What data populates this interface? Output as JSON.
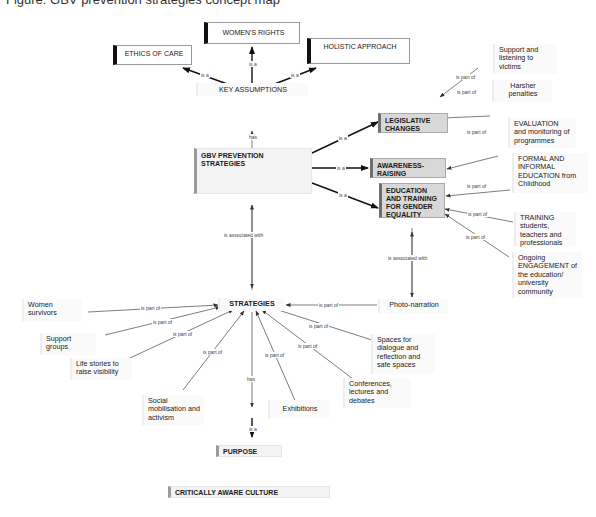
{
  "caption": "Figure: GBV prevention strategies concept map",
  "nodes": {
    "womens_rights": "WOMEN'S RIGHTS",
    "ethics_of_care": "ETHICS OF CARE",
    "holistic_approach": "HOLISTIC APPROACH",
    "key_assumptions": "KEY ASSUMPTIONS",
    "gbv": "GBV PREVENTION STRATEGIES",
    "legislative": "LEGISLATIVE CHANGES",
    "awareness": "AWARENESS-RAISING",
    "education": "EDUCATION AND TRAINING FOR GENDER EQUALITY",
    "support_listening": "Support and listening to victims",
    "harsher": "Harsher penalties",
    "evaluation": "EVALUATION and monitoring of programmes",
    "formal_informal": "FORMAL AND INFORMAL EDUCATION from Childhood",
    "training": "TRAINING students, teachers and professionals",
    "ongoing": "Ongoing ENGAGEMENT of the education/ university community",
    "photo_narration": "Photo-narration",
    "strategies": "STRATEGIES",
    "women_survivors": "Women survivors",
    "support_groups": "Support groups",
    "life_stories": "Life stories to raise visibility",
    "social_mobilisation": "Social mobilisation and activism",
    "exhibitions": "Exhibitions",
    "conferences": "Conferences, lectures and debates",
    "spaces_dialogue": "Spaces for dialogue and reflection and safe spaces",
    "purpose": "PURPOSE",
    "critically_aware": "CRITICALLY AWARE CULTURE"
  },
  "edge_labels": {
    "is_a": "is a",
    "has": "has",
    "is_part_of": "is part of",
    "is_associated_with": "is associated with"
  }
}
